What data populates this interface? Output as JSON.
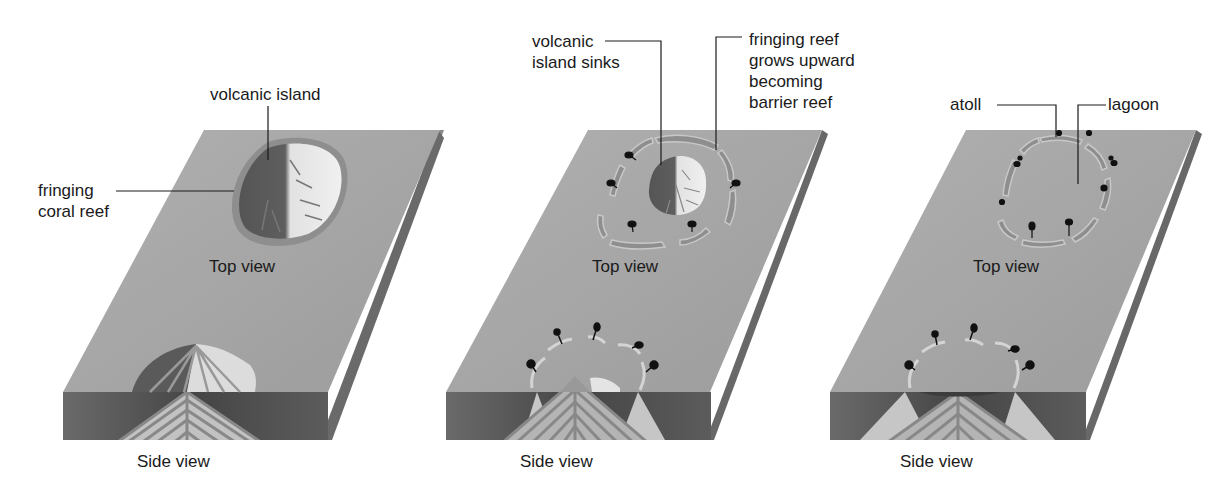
{
  "stages": [
    {
      "id": "stage-1",
      "labels": {
        "volcanic_island": "volcanic island",
        "fringing_reef_line1": "fringing",
        "fringing_reef_line2": "coral reef"
      },
      "top_view": "Top view",
      "side_view": "Side view"
    },
    {
      "id": "stage-2",
      "labels": {
        "island_sinks_line1": "volcanic",
        "island_sinks_line2": "island sinks",
        "barrier_line1": "fringing reef",
        "barrier_line2": "grows upward",
        "barrier_line3": "becoming",
        "barrier_line4": "barrier reef"
      },
      "top_view": "Top view",
      "side_view": "Side view"
    },
    {
      "id": "stage-3",
      "labels": {
        "atoll": "atoll",
        "lagoon": "lagoon"
      },
      "top_view": "Top view",
      "side_view": "Side view"
    }
  ],
  "colors": {
    "ocean_top": "#a6a6a6",
    "ocean_side_dark": "#555555",
    "block_right_face": "#6e6e6e",
    "island_dark": "#5a5a5a",
    "island_light": "#e6e6e6",
    "reef": "#8c8c8c",
    "reef_light": "#c8c8c8",
    "strata": "#8a8a8a",
    "strata_light": "#c4c4c4",
    "tree": "#111111"
  }
}
